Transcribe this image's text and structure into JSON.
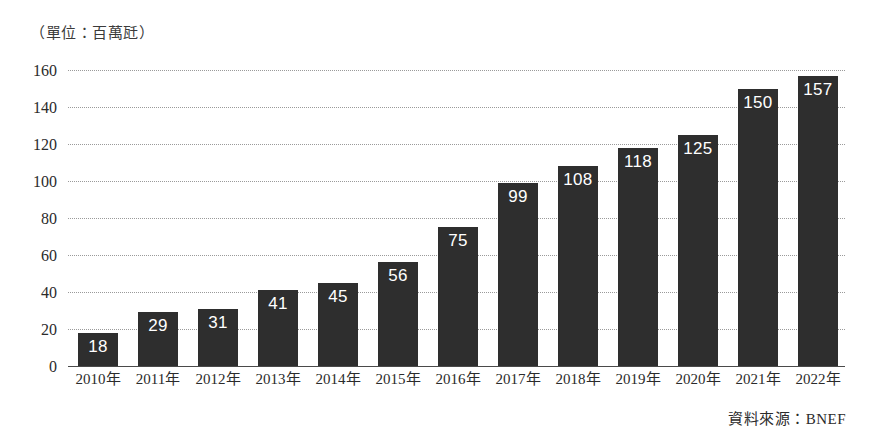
{
  "unit_caption": "（單位：百萬瓩）",
  "source_note": "資料來源：BNEF",
  "chart_data": {
    "type": "bar",
    "title": "",
    "subtitle": "",
    "xlabel": "",
    "ylabel": "",
    "unit_label": "（單位：百萬瓩）",
    "source": "資料來源：BNEF",
    "categories": [
      "2010年",
      "2011年",
      "2012年",
      "2013年",
      "2014年",
      "2015年",
      "2016年",
      "2017年",
      "2018年",
      "2019年",
      "2020年",
      "2021年",
      "2022年"
    ],
    "values": [
      18,
      29,
      31,
      41,
      45,
      56,
      75,
      99,
      108,
      118,
      125,
      150,
      157
    ],
    "data_labels": [
      "18",
      "29",
      "31",
      "41",
      "45",
      "56",
      "75",
      "99",
      "108",
      "118",
      "125",
      "150",
      "157"
    ],
    "ylim": [
      0,
      160
    ],
    "ytick_values": [
      0,
      20,
      40,
      60,
      80,
      100,
      120,
      140,
      160
    ],
    "ytick_labels": [
      "0",
      "20",
      "40",
      "60",
      "80",
      "100",
      "120",
      "140",
      "160"
    ],
    "grid": true,
    "grid_style": "dotted",
    "legend": false,
    "legend_position": "none",
    "bar_color": "#2e2e2e",
    "data_label_color": "#ffffff",
    "grid_color": "#9a9a9a",
    "axis_color": "#4a4a4a",
    "background_color": "#ffffff"
  }
}
